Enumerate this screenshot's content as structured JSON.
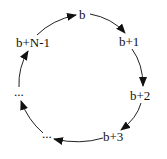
{
  "diagram": {
    "type": "cyclic-sequence",
    "direction": "clockwise",
    "nodes": [
      {
        "id": "n0",
        "label": "b",
        "x": 82,
        "y": 18
      },
      {
        "id": "n1",
        "label": "b+1",
        "x": 130,
        "y": 46
      },
      {
        "id": "n2",
        "label": "b+2",
        "x": 141,
        "y": 100
      },
      {
        "id": "n3",
        "label": "b+3",
        "x": 114,
        "y": 141
      },
      {
        "id": "n4",
        "label": "...",
        "x": 48,
        "y": 138
      },
      {
        "id": "n5",
        "label": "...",
        "x": 20,
        "y": 95
      },
      {
        "id": "n6",
        "label": "b+N-1",
        "x": 34,
        "y": 47
      }
    ],
    "edges": [
      {
        "from": "b",
        "to": "b+1"
      },
      {
        "from": "b+1",
        "to": "b+2"
      },
      {
        "from": "b+2",
        "to": "b+3"
      },
      {
        "from": "b+3",
        "to": "..."
      },
      {
        "from": "...",
        "to": "..."
      },
      {
        "from": "...",
        "to": "b+N-1"
      },
      {
        "from": "b+N-1",
        "to": "b"
      }
    ],
    "colors": {
      "stroke": "#222222",
      "text": "#111111",
      "background": "#ffffff"
    }
  }
}
